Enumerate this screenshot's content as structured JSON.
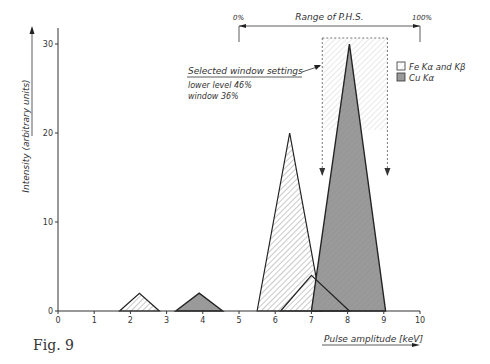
{
  "figure_label": "Fig. 9",
  "chart_data": {
    "type": "area",
    "title": "",
    "xlabel": "Pulse amplitude [keV]",
    "ylabel": "Intensity (arbitrary units)",
    "xlim": [
      0,
      10
    ],
    "ylim": [
      0,
      32
    ],
    "x_ticks": [
      0,
      1,
      2,
      3,
      4,
      5,
      6,
      7,
      8,
      9,
      10
    ],
    "y_ticks": [
      0,
      10,
      20,
      30
    ],
    "grid": false,
    "legend_position": "upper right",
    "series": [
      {
        "name": "Fe Kα and Kβ",
        "fill": "hatched-light",
        "peaks": [
          {
            "x": [
              1.7,
              2.25,
              2.8
            ],
            "y": [
              0,
              2,
              0
            ]
          },
          {
            "x": [
              5.5,
              6.4,
              7.3
            ],
            "y": [
              0,
              20,
              0
            ]
          },
          {
            "x": [
              6.15,
              7.0,
              8.05
            ],
            "y": [
              0,
              4,
              0
            ]
          }
        ]
      },
      {
        "name": "Cu Kα",
        "fill": "gray",
        "peaks": [
          {
            "x": [
              3.25,
              3.9,
              4.55
            ],
            "y": [
              0,
              2,
              0
            ]
          },
          {
            "x": [
              7.0,
              8.05,
              9.05
            ],
            "y": [
              0,
              30,
              0
            ]
          }
        ]
      }
    ],
    "annotations": {
      "range_label": "Range of P.H.S.",
      "range_start": "0%",
      "range_end": "100%",
      "range_x": [
        5,
        10
      ],
      "window_title": "Selected window settings",
      "lower_level": "lower level 46%",
      "window": "window 36%",
      "window_x": [
        7.3,
        9.1
      ]
    }
  }
}
